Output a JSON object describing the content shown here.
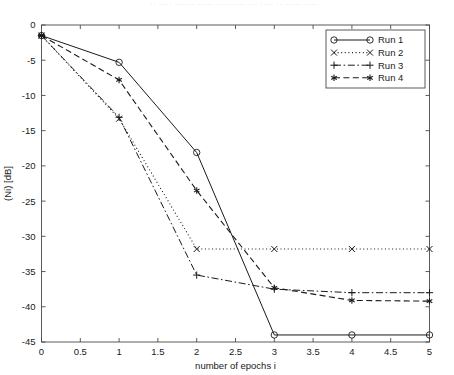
{
  "figure": {
    "top_strip_text": "·· ···· ······ ····· ········· ··· ···· ·· ····· ····",
    "background_color": "#ffffff",
    "line_color": "#1a1a1a",
    "frame_color": "#4a4a4a"
  },
  "chart_data": {
    "type": "line",
    "title": "",
    "xlabel": "number of epochs i",
    "ylabel": "(Ni) [dB]",
    "xlim": [
      0,
      5
    ],
    "ylim": [
      -45,
      0
    ],
    "xticks": [
      0,
      0.5,
      1,
      1.5,
      2,
      2.5,
      3,
      3.5,
      4,
      4.5,
      5
    ],
    "xticklabels": [
      "0",
      "0.5",
      "1",
      "1.5",
      "2",
      "2.5",
      "3",
      "3.5",
      "4",
      "4.5",
      "5"
    ],
    "yticks": [
      0,
      -5,
      -10,
      -15,
      -20,
      -25,
      -30,
      -35,
      -40,
      -45
    ],
    "yticklabels": [
      "0",
      "-5",
      "-10",
      "-15",
      "-20",
      "-25",
      "-30",
      "-35",
      "-40",
      "-45"
    ],
    "grid": false,
    "legend_position": "upper right",
    "x": [
      0,
      1,
      2,
      3,
      4,
      5
    ],
    "series": [
      {
        "name": "Run 1",
        "values": [
          -1.5,
          -5.3,
          -18.1,
          -44.0,
          -44.0,
          -44.0
        ],
        "linestyle": "solid",
        "marker": "circle"
      },
      {
        "name": "Run 2",
        "values": [
          -1.5,
          -13.3,
          -31.8,
          -31.8,
          -31.8,
          -31.8
        ],
        "linestyle": "dotted",
        "marker": "cross"
      },
      {
        "name": "Run 3",
        "values": [
          -1.5,
          -13.1,
          -35.5,
          -37.5,
          -38.0,
          -38.0
        ],
        "linestyle": "dashdot",
        "marker": "plus"
      },
      {
        "name": "Run 4",
        "values": [
          -1.5,
          -7.8,
          -23.5,
          -37.3,
          -39.1,
          -39.2
        ],
        "linestyle": "dashed",
        "marker": "asterisk"
      }
    ]
  }
}
